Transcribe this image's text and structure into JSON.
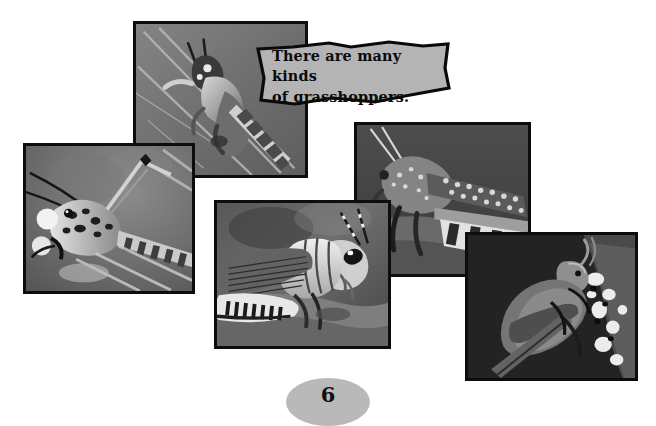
{
  "page": {
    "number": "6",
    "background_color": "#ffffff",
    "border_color": "#0d0d0d",
    "callout_fill": "#b4b4b4",
    "pagenum_fill": "#b9b9b9"
  },
  "callout": {
    "text": "There are many kinds\nof grasshoppers.",
    "line1": "There are many kinds",
    "line2": "of grasshoppers."
  },
  "photos": [
    {
      "id": "photo-grasshopper-on-stem",
      "alt": "Grasshopper climbing a grass stem, viewed from above",
      "position": "top-center-left"
    },
    {
      "id": "photo-lubber-grasshopper-closeup",
      "alt": "Close-up of a lubber grasshopper head with long antennae facing left",
      "position": "left"
    },
    {
      "id": "photo-grasshopper-profile",
      "alt": "Grasshopper in profile facing right showing large eye and striped hind leg",
      "position": "center-bottom"
    },
    {
      "id": "photo-grasshopper-banded-leg",
      "alt": "Grasshopper facing left with speckled wing and banded hind leg",
      "position": "right-upper"
    },
    {
      "id": "photo-dark-grasshopper-on-twig",
      "alt": "Dark grasshopper perched on a lichen covered twig",
      "position": "bottom-right"
    }
  ]
}
